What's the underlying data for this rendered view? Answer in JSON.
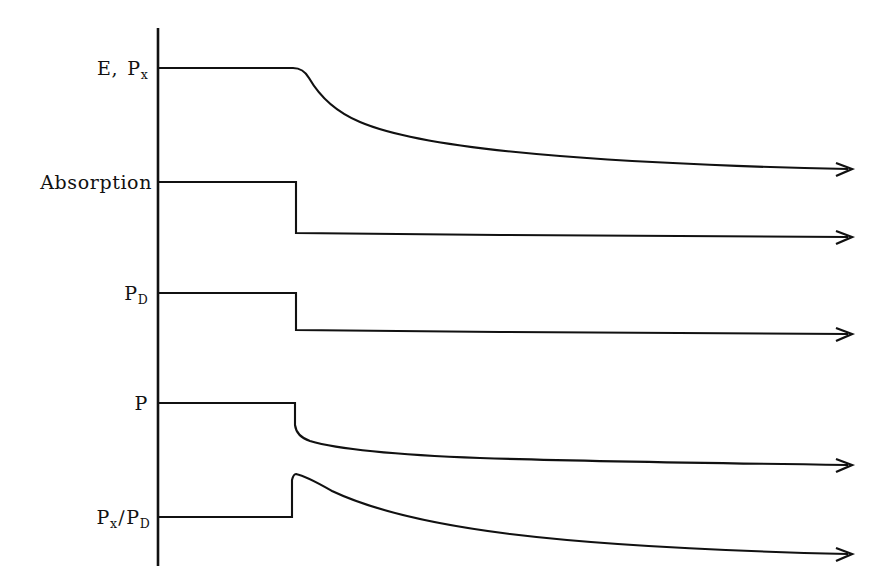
{
  "figure": {
    "background_color": "#ffffff",
    "ink_color": "#111111",
    "width": 883,
    "height": 587
  },
  "axis": {
    "name": "vertical-axis",
    "x": 158,
    "y_top": 28,
    "y_bottom": 566
  },
  "labels": [
    {
      "id": "label-e-px",
      "main": "E",
      "sep": ",",
      "second": "P",
      "sub2": "x",
      "x_right": 148,
      "y": 68
    },
    {
      "id": "label-absorption",
      "main": "Absorption",
      "sep": "",
      "second": "",
      "sub2": "",
      "x_right": 152,
      "y": 182
    },
    {
      "id": "label-pd",
      "main": "P",
      "sep": "",
      "second": "",
      "sub2": "D",
      "x_right": 148,
      "y": 293
    },
    {
      "id": "label-p",
      "main": "P",
      "sep": "",
      "second": "",
      "sub2": "",
      "x_right": 148,
      "y": 403
    },
    {
      "id": "label-px-over-pd",
      "main": "P",
      "sep": "",
      "second": "P",
      "sub2": "D",
      "x_right": 150,
      "y": 517,
      "sub1": "x",
      "slash": "∕"
    }
  ],
  "chart_data": {
    "type": "line",
    "title": "",
    "xlabel": "",
    "ylabel": "",
    "grid": false,
    "legend": false,
    "axis_style": "single vertical axis on left; each trace terminates in a right-pointing arrow",
    "event_x": 296,
    "event_description": "step change applied at a single time; traces respond with either an abrupt step or an exponential relaxation",
    "xlim": [
      158,
      855
    ],
    "ylim": [
      566,
      28
    ],
    "series": [
      {
        "name": "E, Px",
        "label": "E, P_x",
        "response": "flat then smooth exponential decay to lower plateau",
        "baseline_y": 68,
        "step_y": 68,
        "final_y": 113,
        "arrow_tip_x": 855,
        "arrow_tip_y": 113
      },
      {
        "name": "Absorption",
        "label": "Absorption",
        "response": "flat then abrupt vertical step down to new flat level",
        "baseline_y": 182,
        "step_y": 233,
        "final_y": 237,
        "arrow_tip_x": 855,
        "arrow_tip_y": 237
      },
      {
        "name": "PD",
        "label": "P_D",
        "response": "flat then abrupt vertical step down to new flat level",
        "baseline_y": 293,
        "step_y": 330,
        "final_y": 334,
        "arrow_tip_x": 855,
        "arrow_tip_y": 334
      },
      {
        "name": "P",
        "label": "P",
        "response": "flat then abrupt step down followed by slow exponential decay",
        "baseline_y": 403,
        "step_y": 432,
        "final_y": 458,
        "arrow_tip_x": 855,
        "arrow_tip_y": 458
      },
      {
        "name": "Px/PD",
        "label": "P_x / P_D",
        "response": "flat then abrupt step up to a peak followed by slow exponential decay",
        "baseline_y": 517,
        "step_y": 474,
        "final_y": 549,
        "arrow_tip_x": 855,
        "arrow_tip_y": 549
      }
    ]
  }
}
